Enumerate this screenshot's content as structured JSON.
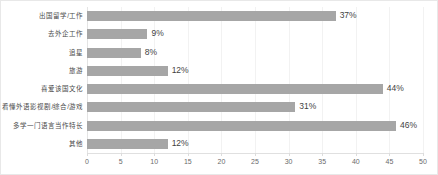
{
  "chart_data": {
    "type": "bar",
    "orientation": "horizontal",
    "title": "",
    "subtitle": "",
    "xlabel": "",
    "ylabel": "",
    "xlim": [
      0,
      50
    ],
    "xticks": [
      0,
      5,
      10,
      15,
      20,
      25,
      30,
      35,
      40,
      45,
      50
    ],
    "xtick_labels": [
      "0",
      "5",
      "10",
      "15",
      "20",
      "25",
      "30",
      "35",
      "40",
      "45",
      "50"
    ],
    "grid": true,
    "grid_axis": "x",
    "legend": false,
    "legend_position": "none",
    "value_suffix": "%",
    "categories": [
      "出国留学/工作",
      "去外企工作",
      "追星",
      "旅游",
      "喜爱该国文化",
      "看懂外语影视剧/综合/游戏",
      "多学一门语言当作特长",
      "其他"
    ],
    "values": [
      37,
      9,
      8,
      12,
      44,
      31,
      46,
      12
    ],
    "data_labels": [
      "37%",
      "9%",
      "8%",
      "12%",
      "44%",
      "31%",
      "46%",
      "12%"
    ],
    "series": [
      {
        "name": "占比",
        "values": [
          37,
          9,
          8,
          12,
          44,
          31,
          46,
          12
        ]
      }
    ]
  },
  "style": {
    "bar_color": "#a6a6a6",
    "gridline_color": "#f2f2f2",
    "axis_color": "#e0e0e0",
    "label_color": "#4a4a4a",
    "value_color": "#3f3f3f",
    "tick_color": "#6b6b6b",
    "background": "#ffffff",
    "border_color": "#e8e8e8"
  }
}
